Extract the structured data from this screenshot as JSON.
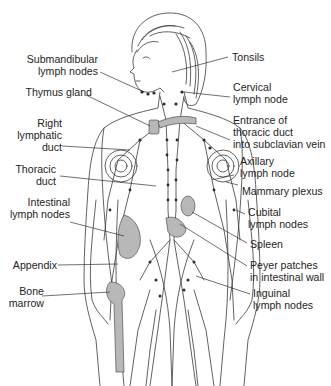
{
  "diagram": {
    "colors": {
      "line": "#3a3a3a",
      "organ_fill": "#b8b8b8",
      "node": "#2a2a2a",
      "background": "#ffffff"
    },
    "labels_left": [
      {
        "id": "submandibular",
        "text": "Submandibular\nlymph nodes"
      },
      {
        "id": "thymus",
        "text": "Thymus gland"
      },
      {
        "id": "right-lymphatic-duct",
        "text": "Right\nlymphatic\nduct"
      },
      {
        "id": "thoracic-duct",
        "text": "Thoracic\nduct"
      },
      {
        "id": "intestinal-nodes",
        "text": "Intestinal\nlymph nodes"
      },
      {
        "id": "appendix",
        "text": "Appendix"
      },
      {
        "id": "bone-marrow",
        "text": "Bone\nmarrow"
      }
    ],
    "labels_right": [
      {
        "id": "tonsils",
        "text": "Tonsils"
      },
      {
        "id": "cervical",
        "text": "Cervical\nlymph node"
      },
      {
        "id": "thoracic-entrance",
        "text": "Entrance of\nthoracic duct\ninto subclavian vein"
      },
      {
        "id": "axillary",
        "text": "Axillary\nlymph node"
      },
      {
        "id": "mammary",
        "text": "Mammary plexus"
      },
      {
        "id": "cubital",
        "text": "Cubital\nlymph nodes"
      },
      {
        "id": "spleen",
        "text": "Spleen"
      },
      {
        "id": "peyer",
        "text": "Peyer patches\nin intestinal wall"
      },
      {
        "id": "inguinal",
        "text": "Inguinal\nlymph nodes"
      }
    ]
  }
}
